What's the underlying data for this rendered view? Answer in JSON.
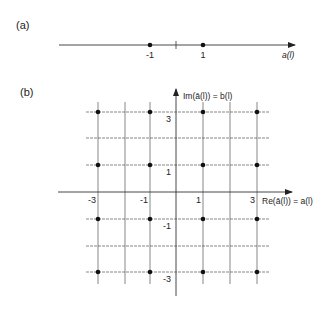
{
  "panel_a": {
    "label": "(a)",
    "axis_label_main": "a",
    "axis_label_arg": "(l)",
    "points": [
      {
        "x": -1,
        "label": "-1"
      },
      {
        "x": 1,
        "label": "1"
      }
    ],
    "ticks": [
      0
    ]
  },
  "panel_b": {
    "label": "(b)",
    "x_axis_label": "Re(ā(l)) = a(l)",
    "y_axis_label": "Im(ā(l)) = b(l)",
    "x_tick_labels": [
      "-3",
      "-1",
      "1",
      "3"
    ],
    "y_tick_labels": [
      "3",
      "1",
      "-1",
      "-3"
    ],
    "grid_values": [
      -3,
      -2,
      -1,
      1,
      2,
      3
    ],
    "points": [
      {
        "x": -3,
        "y": 3
      },
      {
        "x": -1,
        "y": 3
      },
      {
        "x": 1,
        "y": 3
      },
      {
        "x": 3,
        "y": 3
      },
      {
        "x": -3,
        "y": 1
      },
      {
        "x": -1,
        "y": 1
      },
      {
        "x": 1,
        "y": 1
      },
      {
        "x": 3,
        "y": 1
      },
      {
        "x": -3,
        "y": -1
      },
      {
        "x": -1,
        "y": -1
      },
      {
        "x": 1,
        "y": -1
      },
      {
        "x": 3,
        "y": -1
      },
      {
        "x": -3,
        "y": -3
      },
      {
        "x": -1,
        "y": -3
      },
      {
        "x": 1,
        "y": -3
      },
      {
        "x": 3,
        "y": -3
      }
    ]
  },
  "colors": {
    "line": "#333333",
    "grid": "#555555",
    "dot": "#111111",
    "text": "#222222"
  }
}
